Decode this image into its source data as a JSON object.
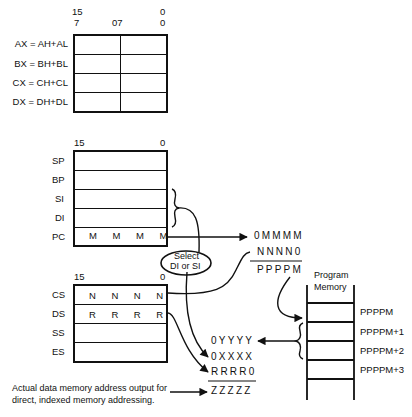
{
  "general_registers": {
    "bit_labels": {
      "top_left": "15",
      "bottom_left": "7",
      "middle": "07",
      "top_right": "0",
      "bottom_right": "0"
    },
    "rows": [
      {
        "label": "AX = AH+AL"
      },
      {
        "label": "BX = BH+BL"
      },
      {
        "label": "CX = CH+CL"
      },
      {
        "label": "DX = DH+DL"
      }
    ]
  },
  "pointer_registers": {
    "bit_labels": {
      "left": "15",
      "right": "0"
    },
    "rows": [
      {
        "label": "SP",
        "cells": ""
      },
      {
        "label": "BP",
        "cells": ""
      },
      {
        "label": "SI",
        "cells": ""
      },
      {
        "label": "DI",
        "cells": ""
      },
      {
        "label": "PC",
        "cells": "M    M    M    M"
      }
    ]
  },
  "segment_registers": {
    "bit_labels": {
      "left": "15",
      "right": "0"
    },
    "rows": [
      {
        "label": "CS",
        "cells": "N    N    N    N"
      },
      {
        "label": "DS",
        "cells": "R    R    R    R"
      },
      {
        "label": "SS",
        "cells": ""
      },
      {
        "label": "ES",
        "cells": ""
      }
    ]
  },
  "select_oval": {
    "line1": "Select",
    "line2": "DI or SI"
  },
  "program_address_sum": {
    "operand1": "0MMMM",
    "operand2": "NNNN0",
    "result": "PPPPM"
  },
  "program_memory": {
    "title_line1": "Program",
    "title_line2": "Memory",
    "locations": [
      "PPPPM",
      "PPPPM+1",
      "PPPPM+2",
      "PPPPM+3"
    ]
  },
  "data_address_sum": {
    "operand1": "0YYYY",
    "operand2": "0XXXX",
    "operand3": "RRRR0",
    "result": "ZZZZZ"
  },
  "caption": {
    "line1": "Actual data memory address output for",
    "line2": "direct, indexed memory addressing."
  }
}
